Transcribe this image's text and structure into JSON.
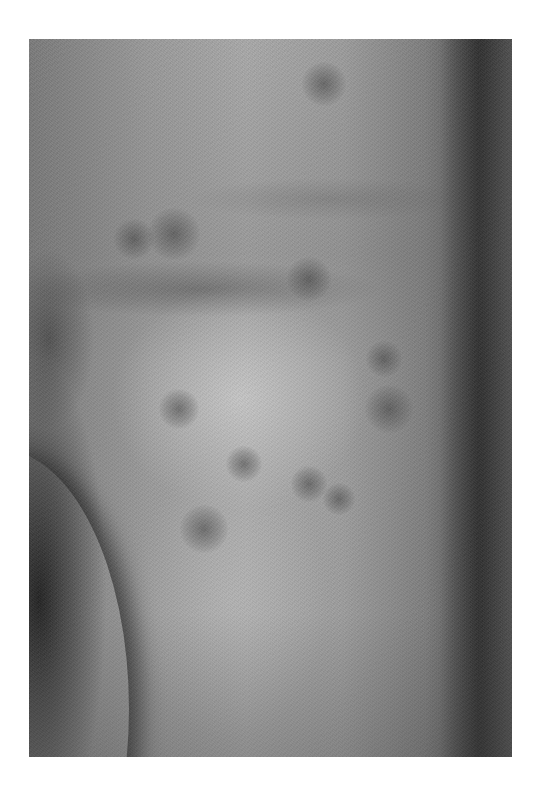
{
  "image": {
    "type": "clinical-photograph",
    "color_mode": "grayscale",
    "subject": "skin of lateral torso and hip with multiple faint dark macular lesions",
    "background_color": "#ffffff",
    "frame": {
      "left": 29,
      "top": 39,
      "width": 483,
      "height": 718
    }
  },
  "lesions": [
    {
      "x": 295,
      "y": 45,
      "r": 22
    },
    {
      "x": 145,
      "y": 195,
      "r": 26
    },
    {
      "x": 105,
      "y": 200,
      "r": 20
    },
    {
      "x": 280,
      "y": 240,
      "r": 22
    },
    {
      "x": 150,
      "y": 370,
      "r": 20
    },
    {
      "x": 360,
      "y": 370,
      "r": 24
    },
    {
      "x": 215,
      "y": 425,
      "r": 18
    },
    {
      "x": 280,
      "y": 445,
      "r": 18
    },
    {
      "x": 310,
      "y": 460,
      "r": 16
    },
    {
      "x": 175,
      "y": 490,
      "r": 24
    },
    {
      "x": 355,
      "y": 320,
      "r": 18
    }
  ]
}
